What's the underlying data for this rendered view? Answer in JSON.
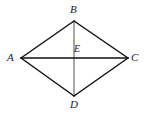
{
  "figure": {
    "type": "geometry-diagram",
    "shape": "rhombus",
    "background_color": "#ffffff",
    "outline_color": "#111111",
    "diagonal_horizontal_color": "#111111",
    "diagonal_vertical_color": "#7a7a7a",
    "label_color": "#1a1a1a",
    "points": [
      {
        "name": "A",
        "label": "A",
        "x": 21,
        "y": 58,
        "role": "left-vertex"
      },
      {
        "name": "B",
        "label": "B",
        "x": 74,
        "y": 21,
        "role": "top-vertex"
      },
      {
        "name": "C",
        "label": "C",
        "x": 128,
        "y": 58,
        "role": "right-vertex"
      },
      {
        "name": "D",
        "label": "D",
        "x": 74,
        "y": 96,
        "role": "bottom-vertex"
      },
      {
        "name": "E",
        "label": "E",
        "x": 74,
        "y": 58,
        "role": "diagonal-intersection"
      }
    ],
    "edges": [
      {
        "name": "AB",
        "from": "A",
        "to": "B",
        "kind": "side"
      },
      {
        "name": "BC",
        "from": "B",
        "to": "C",
        "kind": "side"
      },
      {
        "name": "CD",
        "from": "C",
        "to": "D",
        "kind": "side"
      },
      {
        "name": "DA",
        "from": "D",
        "to": "A",
        "kind": "side"
      },
      {
        "name": "AC",
        "from": "A",
        "to": "C",
        "kind": "diagonal"
      },
      {
        "name": "BD",
        "from": "B",
        "to": "D",
        "kind": "diagonal"
      }
    ]
  }
}
